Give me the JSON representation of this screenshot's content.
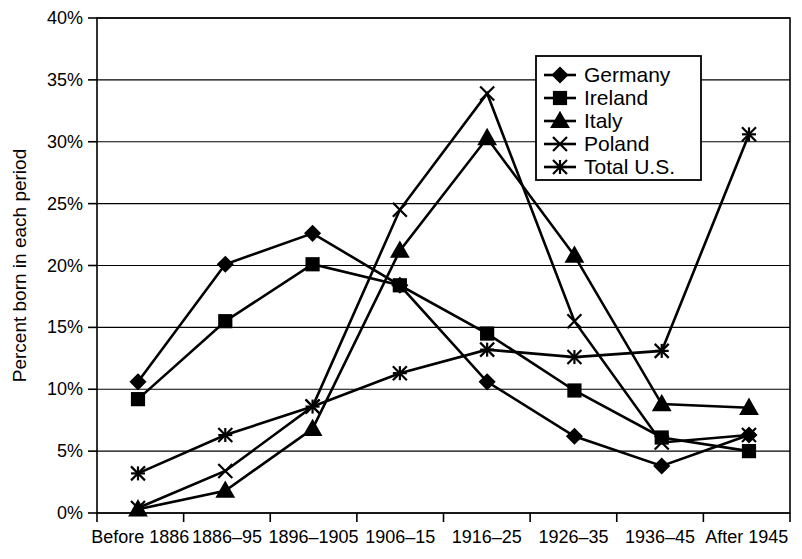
{
  "chart_data": {
    "type": "line",
    "title": "",
    "xlabel": "",
    "ylabel": "Percent born in each period",
    "ylim": [
      0,
      40
    ],
    "ytick_labels": [
      "0%",
      "5%",
      "10%",
      "15%",
      "20%",
      "25%",
      "30%",
      "35%",
      "40%"
    ],
    "ytick_values": [
      0,
      5,
      10,
      15,
      20,
      25,
      30,
      35,
      40
    ],
    "grid": true,
    "legend_position": "top-right",
    "categories": [
      "Before 1886",
      "1886–95",
      "1896–1905",
      "1906–15",
      "1916–25",
      "1926–35",
      "1936–45",
      "After 1945"
    ],
    "series": [
      {
        "name": "Germany",
        "marker": "diamond",
        "values": [
          10.6,
          20.1,
          22.6,
          18.4,
          10.6,
          6.2,
          3.8,
          6.3
        ]
      },
      {
        "name": "Ireland",
        "marker": "square",
        "values": [
          9.2,
          15.5,
          20.1,
          18.4,
          14.5,
          9.9,
          6.1,
          5.0
        ]
      },
      {
        "name": "Italy",
        "marker": "triangle",
        "values": [
          0.3,
          1.8,
          6.8,
          21.2,
          30.3,
          20.8,
          8.8,
          8.5
        ]
      },
      {
        "name": "Poland",
        "marker": "cross",
        "values": [
          0.4,
          3.4,
          8.6,
          24.5,
          33.9,
          15.5,
          5.7,
          6.3
        ]
      },
      {
        "name": "Total U.S.",
        "marker": "star",
        "values": [
          3.2,
          6.3,
          8.6,
          11.3,
          13.2,
          12.6,
          13.1,
          30.6
        ]
      }
    ]
  },
  "legend": {
    "items": [
      {
        "label": "Germany",
        "marker": "diamond"
      },
      {
        "label": "Ireland",
        "marker": "square"
      },
      {
        "label": "Italy",
        "marker": "triangle"
      },
      {
        "label": "Poland",
        "marker": "cross"
      },
      {
        "label": "Total U.S.",
        "marker": "star"
      }
    ]
  },
  "colors": {
    "ink": "#000000",
    "paper": "#ffffff"
  }
}
